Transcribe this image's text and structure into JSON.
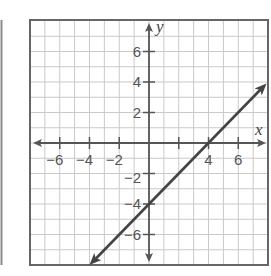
{
  "chart_data": {
    "type": "line",
    "title": "",
    "xlabel": "x",
    "ylabel": "y",
    "xlim": [
      -8,
      8
    ],
    "ylim": [
      -8,
      8
    ],
    "grid": true,
    "grid_step": 1,
    "x_ticks": [
      -6,
      -4,
      -2,
      4,
      6
    ],
    "x_tick_labels": [
      "−6",
      "−4",
      "−2",
      "4",
      "6"
    ],
    "y_ticks": [
      6,
      4,
      2,
      -2,
      -4,
      -6
    ],
    "y_tick_labels": [
      "6",
      "4",
      "2",
      "−2",
      "−4",
      "−6"
    ],
    "series": [
      {
        "name": "line",
        "equation": "y = x - 4",
        "slope": 1,
        "y_intercept": -4,
        "x_intercept": 4,
        "x": [
          -4,
          0,
          4,
          8
        ],
        "y": [
          -8,
          -4,
          0,
          4
        ],
        "arrows": "both ends"
      }
    ],
    "legend": "none"
  },
  "colors": {
    "grid": "#c9c9c9",
    "axis": "#555555",
    "frame": "#666666",
    "line": "#444444",
    "background": "#ffffff"
  },
  "labels": {
    "x_axis_name": "x",
    "y_axis_name": "y"
  }
}
